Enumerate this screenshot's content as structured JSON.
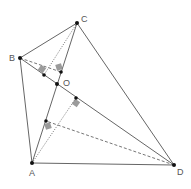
{
  "diagram": {
    "colors": {
      "line": "#666666",
      "point": "#111111",
      "mark": "#8a8a8a",
      "label": "#555555"
    },
    "points": {
      "A": {
        "label": "A",
        "x": 32,
        "y": 163
      },
      "B": {
        "label": "B",
        "x": 20,
        "y": 58
      },
      "C": {
        "label": "C",
        "x": 77,
        "y": 23
      },
      "D": {
        "label": "D",
        "x": 174,
        "y": 165
      },
      "O": {
        "label": "O",
        "x": 57,
        "y": 84
      }
    },
    "labels": {
      "A": "A",
      "B": "B",
      "C": "C",
      "D": "D",
      "O": "O"
    }
  }
}
